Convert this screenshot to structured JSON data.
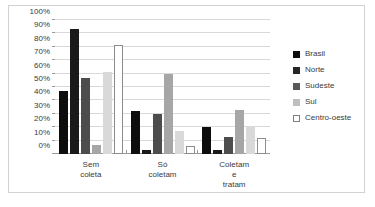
{
  "chart_data": {
    "type": "bar",
    "title": "",
    "subtitle": "",
    "xlabel": "",
    "ylabel": "",
    "categories": [
      "Sem coleta",
      "Só coletam",
      "Coletam e\ntratam"
    ],
    "series": [
      {
        "name": "Brasil",
        "color": "#0d0d0d",
        "border": "#0d0d0d",
        "values": [
          47,
          32,
          20
        ]
      },
      {
        "name": "Norte",
        "color": "#1a1a1a",
        "border": "#1a1a1a",
        "values": [
          93,
          3,
          3
        ]
      },
      {
        "name": "Sudeste",
        "color": "#4d4d4d",
        "border": "#4d4d4d",
        "values": [
          57,
          30,
          13
        ]
      },
      {
        "name": "Sul",
        "color": "#a6a6a6",
        "border": "#a6a6a6",
        "values": [
          7,
          60,
          33
        ]
      },
      {
        "name": "Centro-oeste",
        "color": "#d9d9d9",
        "border": "#d9d9d9",
        "values": [
          61,
          17,
          21
        ]
      },
      {
        "name": "Centro-oeste",
        "color": "#ffffff",
        "border": "#8c8c8c",
        "values": [
          81,
          6,
          12
        ]
      }
    ],
    "ylim": [
      0,
      100
    ],
    "yticks": [
      "0%",
      "10%",
      "20%",
      "30%",
      "40%",
      "50%",
      "60%",
      "70%",
      "80%",
      "90%",
      "100%"
    ],
    "ytick_values": [
      0,
      10,
      20,
      30,
      40,
      50,
      60,
      70,
      80,
      90,
      100
    ],
    "grid": true,
    "legend_position": "right",
    "legend": [
      {
        "label": "Brasil",
        "color": "#0d0d0d",
        "border": "#0d0d0d"
      },
      {
        "label": "Norte",
        "color": "#262626",
        "border": "#262626"
      },
      {
        "label": "Sudeste",
        "color": "#595959",
        "border": "#595959"
      },
      {
        "label": "Sul",
        "color": "#bfbfbf",
        "border": "#bfbfbf"
      },
      {
        "label": "Centro-oeste",
        "color": "#ffffff",
        "border": "#7f7f7f"
      }
    ]
  }
}
